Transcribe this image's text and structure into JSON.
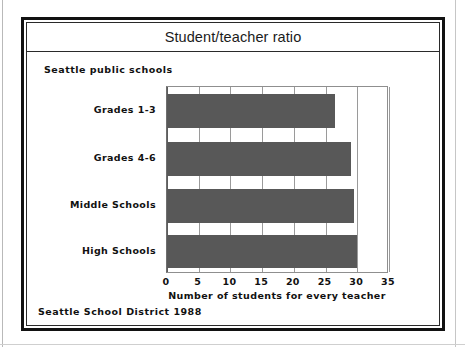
{
  "figure": {
    "title": "Student/teacher ratio",
    "subtitle": "Seattle public schools",
    "footnote": "Seattle School District 1988"
  },
  "chart_data": {
    "type": "bar",
    "orientation": "horizontal",
    "title": "Student/teacher ratio",
    "subtitle": "Seattle public schools",
    "source_note": "Seattle School District 1988",
    "categories": [
      "Grades 1-3",
      "Grades 4-6",
      "Middle Schools",
      "High Schools"
    ],
    "values": [
      26.5,
      29.0,
      29.5,
      30.0
    ],
    "xlabel": "Number of students for every teacher",
    "ylabel": "",
    "xlim": [
      0,
      35
    ],
    "xticks": [
      "0",
      "5",
      "10",
      "15",
      "20",
      "25",
      "30",
      "35"
    ],
    "xtick_values": [
      0,
      5,
      10,
      15,
      20,
      25,
      30,
      35
    ],
    "grid": "vertical",
    "legend": "none",
    "bar_color": "#585858",
    "background_color": "#ffffff",
    "frame_color": "#121212"
  }
}
